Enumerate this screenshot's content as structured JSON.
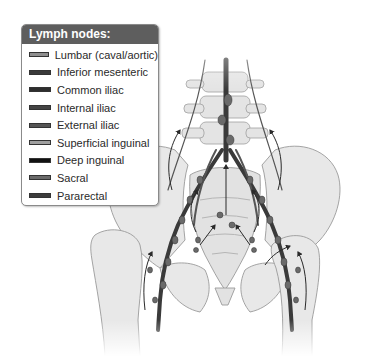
{
  "legend": {
    "title": "Lymph nodes:",
    "items": [
      {
        "label": "Lumbar (caval/aortic)",
        "color": "#8f8f8f"
      },
      {
        "label": "Inferior mesenteric",
        "color": "#3a3a3a"
      },
      {
        "label": "Common iliac",
        "color": "#2e2e2e"
      },
      {
        "label": "Internal iliac",
        "color": "#444444"
      },
      {
        "label": "External iliac",
        "color": "#555555"
      },
      {
        "label": "Superficial inguinal",
        "color": "#a0a0a0"
      },
      {
        "label": "Deep inguinal",
        "color": "#111111"
      },
      {
        "label": "Sacral",
        "color": "#6a6a6a"
      },
      {
        "label": "Pararectal",
        "color": "#3c3c3c"
      }
    ]
  },
  "illustration": {
    "subject": "pelvis-lymphatic-drainage",
    "bone_color": "#e6e6e6",
    "bone_outline": "#9a9a9a",
    "vessel_color": "#3a3a3a",
    "arrow_color": "#2a2a2a"
  }
}
